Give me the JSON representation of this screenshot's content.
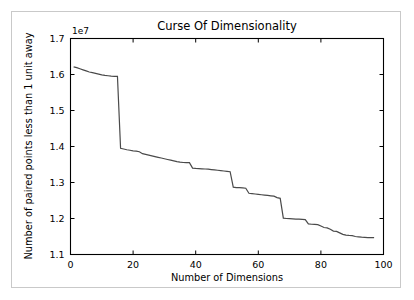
{
  "chart_data": {
    "type": "line",
    "title": "Curse Of Dimensionality",
    "xlabel": "Number of Dimensions",
    "ylabel": "Number of paired points less than 1 unit away",
    "y_offset_text": "1e7",
    "xlim": [
      0,
      100
    ],
    "ylim": [
      11000000,
      17000000
    ],
    "xticks": [
      0,
      20,
      40,
      60,
      80,
      100
    ],
    "xticklabels": [
      "0",
      "20",
      "40",
      "60",
      "80",
      "100"
    ],
    "yticks": [
      11000000,
      12000000,
      13000000,
      14000000,
      15000000,
      16000000,
      17000000
    ],
    "yticklabels": [
      "1.1",
      "1.2",
      "1.3",
      "1.4",
      "1.5",
      "1.6",
      "1.7"
    ],
    "grid": false,
    "legend": null,
    "line_color": "#4a4a4a",
    "series": [
      {
        "name": "paired points within 1 unit",
        "x": [
          1,
          2,
          3,
          4,
          5,
          6,
          7,
          8,
          9,
          10,
          11,
          12,
          13,
          14,
          15,
          16,
          17,
          18,
          19,
          20,
          21,
          22,
          23,
          24,
          25,
          26,
          27,
          28,
          29,
          30,
          31,
          32,
          33,
          34,
          35,
          36,
          37,
          38,
          39,
          40,
          41,
          42,
          43,
          44,
          45,
          46,
          47,
          48,
          49,
          50,
          51,
          52,
          53,
          54,
          55,
          56,
          57,
          58,
          59,
          60,
          61,
          62,
          63,
          64,
          65,
          66,
          67,
          68,
          69,
          70,
          71,
          72,
          73,
          74,
          75,
          76,
          77,
          78,
          79,
          80,
          81,
          82,
          83,
          84,
          85,
          86,
          87,
          88,
          89,
          90,
          91,
          92,
          93,
          94,
          95,
          96,
          97
        ],
        "y": [
          16210000,
          16190000,
          16160000,
          16130000,
          16100000,
          16070000,
          16050000,
          16030000,
          16010000,
          15990000,
          15975000,
          15965000,
          15955000,
          15950000,
          15950000,
          13950000,
          13930000,
          13910000,
          13895000,
          13880000,
          13870000,
          13855000,
          13800000,
          13780000,
          13760000,
          13740000,
          13720000,
          13700000,
          13680000,
          13660000,
          13640000,
          13620000,
          13600000,
          13580000,
          13565000,
          13555000,
          13550000,
          13550000,
          13400000,
          13390000,
          13385000,
          13380000,
          13375000,
          13370000,
          13360000,
          13350000,
          13340000,
          13330000,
          13320000,
          13310000,
          13300000,
          12870000,
          12860000,
          12855000,
          12850000,
          12840000,
          12700000,
          12690000,
          12680000,
          12670000,
          12660000,
          12650000,
          12640000,
          12630000,
          12620000,
          12580000,
          12560000,
          12010000,
          12000000,
          11995000,
          11990000,
          11985000,
          11980000,
          11975000,
          11970000,
          11850000,
          11840000,
          11835000,
          11830000,
          11790000,
          11750000,
          11740000,
          11700000,
          11650000,
          11640000,
          11600000,
          11560000,
          11540000,
          11530000,
          11525000,
          11500000,
          11490000,
          11480000,
          11475000,
          11470000,
          11470000,
          11470000
        ]
      }
    ]
  }
}
